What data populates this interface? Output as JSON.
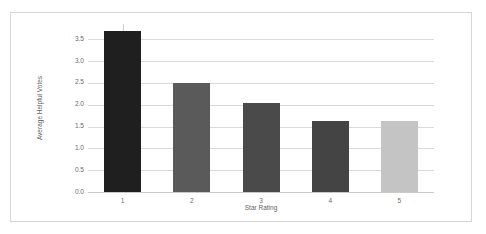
{
  "chart_data": {
    "type": "bar",
    "title": "",
    "xlabel": "Star Rating",
    "ylabel": "Average Helpful Votes",
    "categories": [
      "1",
      "2",
      "3",
      "4",
      "5"
    ],
    "values": [
      3.68,
      2.5,
      2.05,
      1.63,
      1.63
    ],
    "bar_colors": [
      "#1f1f1f",
      "#5a5a5a",
      "#4a4a4a",
      "#444444",
      "#c4c4c4"
    ],
    "ylim": [
      0.0,
      3.85
    ],
    "yticks": [
      0.0,
      0.5,
      1.0,
      1.5,
      2.0,
      2.5,
      3.0,
      3.5
    ],
    "ytick_labels": [
      "0.0",
      "0.5",
      "1.0",
      "1.5",
      "2.0",
      "2.5",
      "3.0",
      "3.5"
    ],
    "grid": true,
    "legend": "none",
    "background_color": "#ffffff",
    "grid_color": "#d9d9d9",
    "frame_color": "#d6d6d6"
  }
}
